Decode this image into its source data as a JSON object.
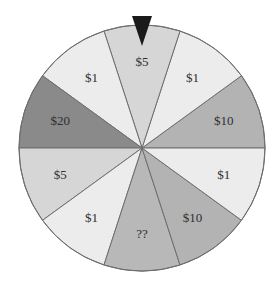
{
  "wheel": {
    "center": [
      142,
      148
    ],
    "radius": 123,
    "outline_color": "#6e6e6e",
    "slice_angle_deg": 36,
    "slices": [
      {
        "label": "$10",
        "start": 0,
        "color": "#b3b3b3"
      },
      {
        "label": "$1",
        "start": 36,
        "color": "#ececec"
      },
      {
        "label": "$5",
        "start": 72,
        "color": "#d6d6d6"
      },
      {
        "label": "$1",
        "start": 108,
        "color": "#ececec"
      },
      {
        "label": "$20",
        "start": 144,
        "color": "#8a8a8a"
      },
      {
        "label": "$5",
        "start": 180,
        "color": "#d6d6d6"
      },
      {
        "label": "$1",
        "start": 216,
        "color": "#ececec"
      },
      {
        "label": "??",
        "start": 252,
        "color": "#b8b8b8"
      },
      {
        "label": "$10",
        "start": 288,
        "color": "#b3b3b3"
      },
      {
        "label": "$1",
        "start": 324,
        "color": "#ececec"
      }
    ],
    "label_radius": 86
  },
  "pointer": {
    "color": "#1a1a1a",
    "points": [
      [
        132,
        16
      ],
      [
        152,
        16
      ],
      [
        142,
        46
      ]
    ],
    "points_at": "$5"
  }
}
